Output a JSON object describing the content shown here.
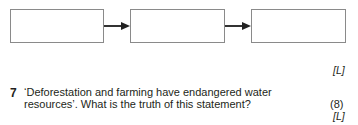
{
  "flow_diagram": {
    "boxes": [
      "",
      "",
      ""
    ],
    "arrow_count": 2
  },
  "previous_question": {
    "level_marker": "[L]"
  },
  "question": {
    "number": "7",
    "line1": "‘Deforestation and farming have endangered water",
    "line2": "resources’. What is the truth of this statement?",
    "marks": "(8)",
    "level_marker": "[L]"
  }
}
